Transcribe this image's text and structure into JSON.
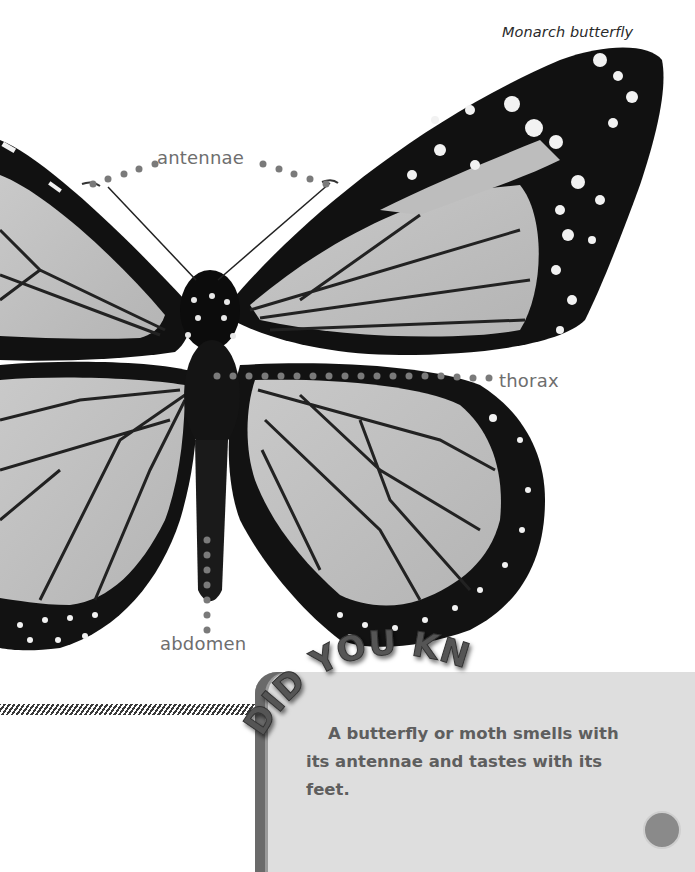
{
  "caption": "Monarch butterfly",
  "labels": {
    "antennae": "antennae",
    "thorax": "thorax",
    "abdomen": "abdomen"
  },
  "fact_box": {
    "heading": "DID YOU KNOW?",
    "text": "A butterfly or moth smells with its antennae and tastes with its feet."
  },
  "colors": {
    "label_text": "#6e6e6e",
    "dot_leader": "#7a7a7a",
    "box_fill": "#dedede",
    "box_edge": "#6a6a6a",
    "heading": "#505050"
  },
  "icons": {
    "butterfly": "monarch-butterfly-illustration",
    "page_tab": "page-corner-tab"
  }
}
